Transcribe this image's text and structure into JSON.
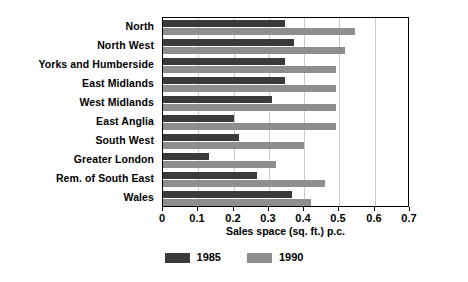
{
  "chart_data": {
    "type": "bar",
    "orientation": "horizontal",
    "title": "",
    "xlabel": "Sales space (sq. ft.) p.c.",
    "ylabel": "",
    "xlim": [
      0,
      0.7
    ],
    "xticks": [
      0,
      0.1,
      0.2,
      0.3,
      0.4,
      0.5,
      0.6,
      0.7
    ],
    "xtick_labels": [
      "0",
      "0.1",
      "0.2",
      "0.3",
      "0.4",
      "0.5",
      "0.6",
      "0.7"
    ],
    "grid": true,
    "grid_axis": "x",
    "legend_position": "bottom-center",
    "categories": [
      "North",
      "North West",
      "Yorks and Humberside",
      "East Midlands",
      "West Midlands",
      "East Anglia",
      "South West",
      "Greater London",
      "Rem. of South East",
      "Wales"
    ],
    "series": [
      {
        "name": "1985",
        "color": "#3a3a3a",
        "values": [
          0.345,
          0.37,
          0.345,
          0.345,
          0.31,
          0.2,
          0.215,
          0.13,
          0.265,
          0.365
        ]
      },
      {
        "name": "1990",
        "color": "#8e8e8e",
        "values": [
          0.545,
          0.515,
          0.49,
          0.49,
          0.49,
          0.49,
          0.4,
          0.32,
          0.46,
          0.42
        ]
      }
    ]
  },
  "legend": {
    "items": [
      {
        "label": "1985",
        "color": "#3a3a3a"
      },
      {
        "label": "1990",
        "color": "#8e8e8e"
      }
    ]
  },
  "colors": {
    "bar_1985": "#3a3a3a",
    "bar_1990": "#8e8e8e",
    "axis": "#000000",
    "grid": "#c9c9c9",
    "background": "#ffffff"
  }
}
